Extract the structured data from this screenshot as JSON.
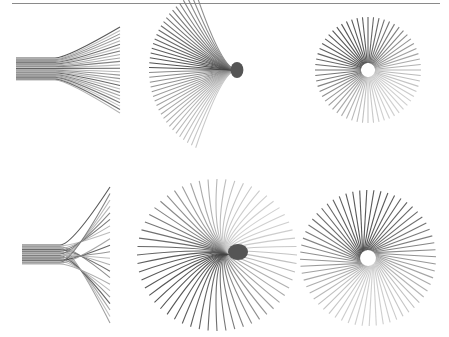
{
  "figure": {
    "rule": {
      "x1": 12,
      "x2": 440,
      "y": 3,
      "color": "#8a8a8a"
    },
    "panels": [
      {
        "id": "top-left",
        "kind": "fan-tube",
        "tube": {
          "x1": 16,
          "x2": 55,
          "y1": 58,
          "y2": 80
        },
        "fan_end_x": 120,
        "fan_y": [
          27,
          113
        ],
        "rays": 26,
        "crossing": false
      },
      {
        "id": "top-middle",
        "kind": "half-burst",
        "cx": 237,
        "cy": 70,
        "r": 88,
        "start_deg": 118,
        "end_deg": 242,
        "rays": 40,
        "cap_r": 8
      },
      {
        "id": "top-right",
        "kind": "burst",
        "cx": 368,
        "cy": 70,
        "r_inner": 7,
        "r_outer": 53,
        "rays": 60,
        "twist_deg": 0
      },
      {
        "id": "bottom-left",
        "kind": "fan-tube",
        "tube": {
          "x1": 22,
          "x2": 60,
          "y1": 245,
          "y2": 264
        },
        "fan_end_x": 110,
        "fan_y": [
          187,
          323
        ],
        "rays": 22,
        "crossing": true
      },
      {
        "id": "bottom-middle",
        "kind": "swirl",
        "cx": 232,
        "cy": 255,
        "r": 80,
        "rays": 56,
        "cap_r": 10
      },
      {
        "id": "bottom-right",
        "kind": "burst",
        "cx": 368,
        "cy": 258,
        "r_inner": 8,
        "r_outer": 68,
        "rays": 60,
        "twist_deg": 35
      }
    ],
    "colors": {
      "dark": "#3a3a3a",
      "mid": "#7a7a7a",
      "light": "#c8c8c8"
    }
  }
}
